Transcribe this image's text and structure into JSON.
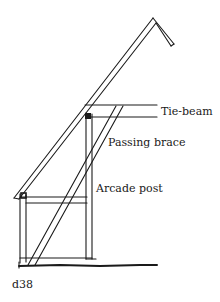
{
  "figure": {
    "id_label": "d38"
  },
  "labels": {
    "tie_beam": "Tie-beam",
    "passing_brace": "Passing brace",
    "arcade_post": "Arcade post"
  },
  "colors": {
    "ink": "#1a1a1a",
    "background": "#ffffff"
  }
}
